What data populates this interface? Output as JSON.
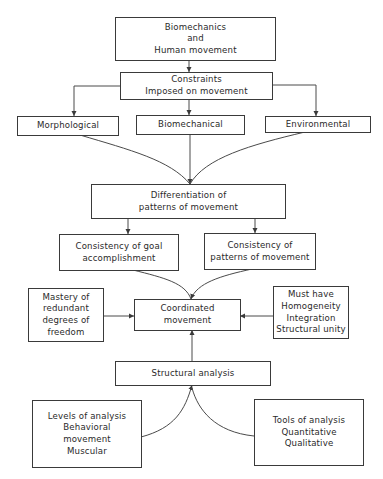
{
  "diagram": {
    "type": "flowchart",
    "nodes": {
      "root": {
        "lines": [
          "Biomechanics",
          "and",
          "Human movement"
        ]
      },
      "constraints": {
        "lines": [
          "Constraints",
          "Imposed on movement"
        ]
      },
      "morphological": {
        "lines": [
          "Morphological"
        ]
      },
      "biomechanical": {
        "lines": [
          "Biomechanical"
        ]
      },
      "environmental": {
        "lines": [
          "Environmental"
        ]
      },
      "differentiation": {
        "lines": [
          "Differentiation of",
          "patterns of movement"
        ]
      },
      "goal": {
        "lines": [
          "Consistency of  goal",
          "accomplishment"
        ]
      },
      "patterns": {
        "lines": [
          "Consistency of",
          "patterns of movement"
        ]
      },
      "mastery": {
        "lines": [
          "Mastery of",
          "redundant",
          "degrees of",
          "freedom"
        ]
      },
      "coordinated": {
        "lines": [
          "Coordinated",
          "movement"
        ]
      },
      "musthave": {
        "lines": [
          "Must have",
          "Homogeneity",
          "Integration",
          "Structural unity"
        ]
      },
      "structural": {
        "lines": [
          "Structural analysis"
        ]
      },
      "levels": {
        "lines": [
          "Levels of analysis",
          "Behavioral",
          "movement",
          "Muscular"
        ]
      },
      "tools": {
        "lines": [
          "Tools of analysis",
          "Quantitative",
          "Qualitative"
        ]
      }
    },
    "edges": [
      {
        "from": "root",
        "to": "constraints"
      },
      {
        "from": "constraints",
        "to": "morphological"
      },
      {
        "from": "constraints",
        "to": "biomechanical"
      },
      {
        "from": "constraints",
        "to": "environmental"
      },
      {
        "from": "morphological",
        "to": "differentiation"
      },
      {
        "from": "biomechanical",
        "to": "differentiation"
      },
      {
        "from": "environmental",
        "to": "differentiation"
      },
      {
        "from": "differentiation",
        "to": "goal"
      },
      {
        "from": "differentiation",
        "to": "patterns"
      },
      {
        "from": "goal",
        "to": "coordinated"
      },
      {
        "from": "patterns",
        "to": "coordinated"
      },
      {
        "from": "mastery",
        "to": "coordinated"
      },
      {
        "from": "musthave",
        "to": "coordinated"
      },
      {
        "from": "structural",
        "to": "coordinated"
      },
      {
        "from": "levels",
        "to": "structural"
      },
      {
        "from": "tools",
        "to": "structural"
      }
    ],
    "colors": {
      "line": "#3a3a3a",
      "text": "#2a2a2a",
      "background": "#ffffff"
    }
  }
}
